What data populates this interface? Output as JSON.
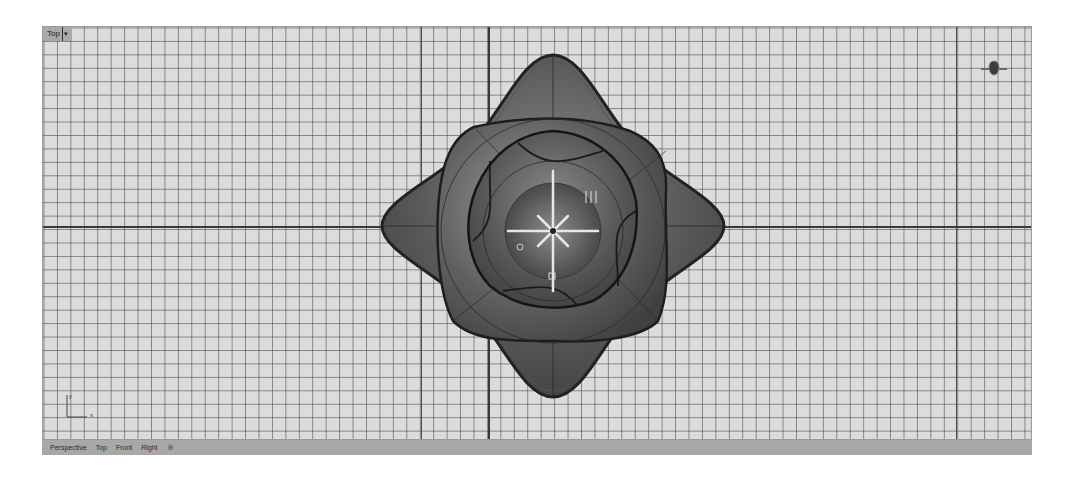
{
  "viewport": {
    "name": "Top",
    "dropdown_glyph": "▾",
    "view_type": "top orthographic, shaded",
    "grid": {
      "minor_spacing_px": 13.45,
      "background": "#dcdcdc",
      "line_color": "#3c3c3c"
    },
    "world_axes": {
      "x_label": "x",
      "y_label": "y"
    },
    "model_description": "four-lobed flower/petal surface with compass-rose emblem at center"
  },
  "tabs": {
    "items": [
      {
        "label": "Perspective"
      },
      {
        "label": "Top"
      },
      {
        "label": "Front"
      },
      {
        "label": "Right"
      }
    ],
    "add_glyph": "⊕"
  },
  "colors": {
    "tabbar_bg": "#a8a8a8",
    "label_bg": "#a9a9a9",
    "model_dark": "#3a3a3a",
    "model_light": "#9a9a9a"
  }
}
